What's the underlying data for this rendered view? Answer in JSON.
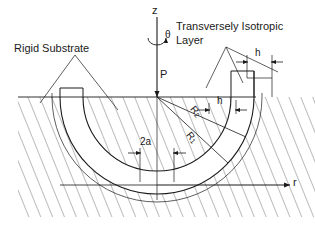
{
  "figure": {
    "name": "axisymmetric-indentation-diagram"
  },
  "annotations": {
    "rigid_substrate": "Rigid Substrate",
    "layer_line1": "Transversely Isotropic",
    "layer_line2": "Layer",
    "load": "P",
    "contact_width": "2a",
    "thickness_outer": "h",
    "thickness_inner": "h",
    "radius_outer_base": "R",
    "radius_outer_sub": "2",
    "radius_inner_base": "R",
    "radius_inner_sub": "1"
  },
  "axes": {
    "vertical": "z",
    "horizontal": "r",
    "angle": "θ"
  },
  "colors": {
    "ink": "#1a1a1a",
    "hatch": "#4a4a4a",
    "background": "#ffffff"
  }
}
